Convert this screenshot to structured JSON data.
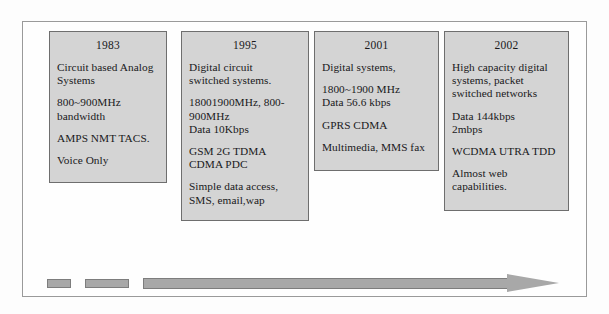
{
  "figure": {
    "frame_border_color": "#9a9a9a",
    "box_fill_color": "#d4d4d4",
    "box_border_color": "#6e6e6e",
    "arrow_fill_color": "#a8a8a8",
    "arrow_border_color": "#7d7d7d"
  },
  "generations": [
    {
      "year": "1983",
      "paragraphs": [
        "Circuit based Analog\nSystems",
        "800~900MHz\nbandwidth",
        "AMPS NMT TACS.",
        "Voice Only"
      ]
    },
    {
      "year": "1995",
      "paragraphs": [
        "Digital circuit\nswitched systems.",
        "18001900MHz, 800-\n900MHz\nData 10Kbps",
        "GSM 2G TDMA\nCDMA PDC",
        "Simple data access,\nSMS, email,wap"
      ]
    },
    {
      "year": "2001",
      "paragraphs": [
        "Digital systems,",
        "1800~1900 MHz\nData 56.6 kbps",
        "GPRS CDMA",
        "Multimedia, MMS fax"
      ]
    },
    {
      "year": "2002",
      "paragraphs": [
        "High capacity digital\nsystems, packet\nswitched networks",
        "Data 144kbps\n2mbps",
        "WCDMA UTRA TDD",
        "Almost web\ncapabilities."
      ]
    }
  ],
  "timeline": {
    "direction": "left-to-right",
    "dashes": 2,
    "arrow_label": ""
  }
}
